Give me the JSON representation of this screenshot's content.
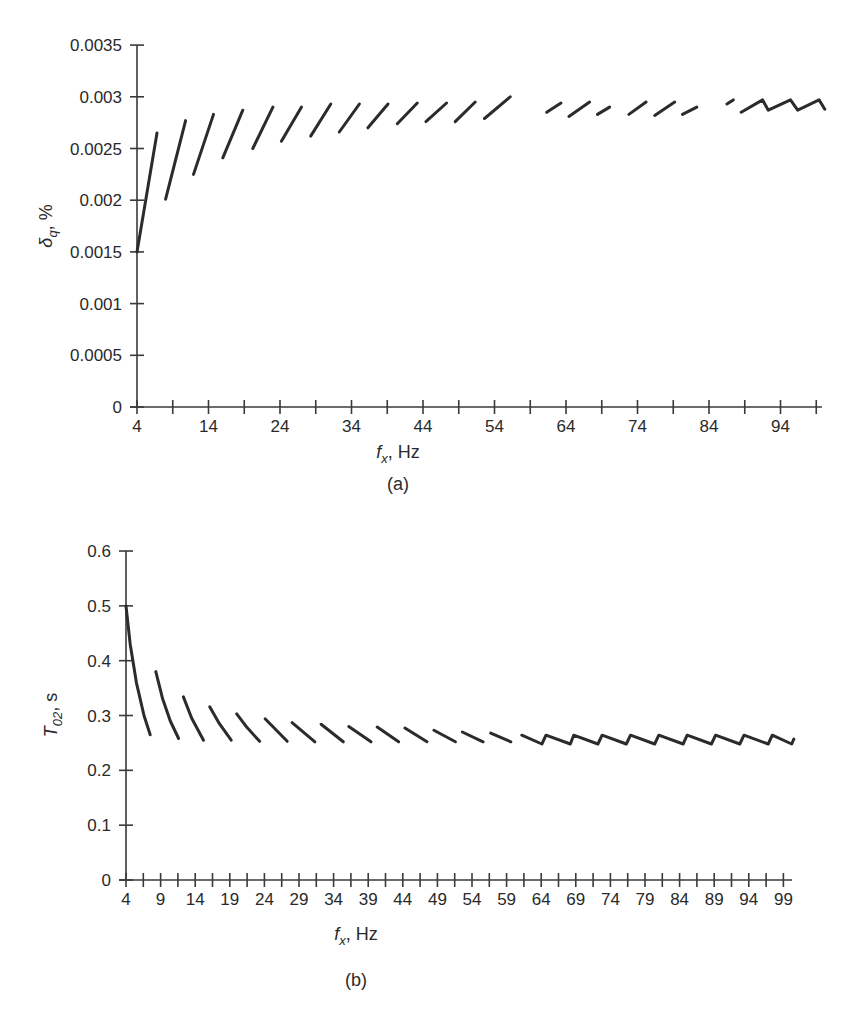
{
  "chart_data": [
    {
      "id": "a",
      "type": "line",
      "panel_label": "(a)",
      "title": "",
      "xlabel": "f_x, Hz",
      "xlabel_var": "f",
      "xlabel_sub": "x",
      "xlabel_unit": ", Hz",
      "ylabel": "δ_q, %",
      "ylabel_var": "δ",
      "ylabel_sub": "q",
      "ylabel_unit": ", %",
      "xlim": [
        4,
        100
      ],
      "ylim": [
        0,
        0.0035
      ],
      "grid": false,
      "legend": null,
      "x_ticks": [
        4,
        9,
        14,
        19,
        24,
        29,
        34,
        39,
        44,
        49,
        54,
        59,
        64,
        69,
        74,
        79,
        84,
        89,
        94,
        99
      ],
      "x_tick_labels": [
        "4",
        "14",
        "24",
        "34",
        "44",
        "54",
        "64",
        "74",
        "84",
        "94"
      ],
      "x_tick_label_values": [
        4,
        14,
        24,
        34,
        44,
        54,
        64,
        74,
        84,
        94
      ],
      "y_ticks": [
        0,
        0.0005,
        0.001,
        0.0015,
        0.002,
        0.0025,
        0.003,
        0.0035
      ],
      "y_tick_labels": [
        "0",
        "0.0005",
        "0.001",
        "0.0015",
        "0.002",
        "0.0025",
        "0.003",
        "0.0035"
      ],
      "series": [
        {
          "name": "δq segments",
          "segments": [
            [
              [
                4.0,
                0.0015
              ],
              [
                6.8,
                0.00265
              ]
            ],
            [
              [
                8.0,
                0.00201
              ],
              [
                10.8,
                0.00277
              ]
            ],
            [
              [
                11.9,
                0.00225
              ],
              [
                14.7,
                0.00283
              ]
            ],
            [
              [
                16.0,
                0.00241
              ],
              [
                18.8,
                0.00287
              ]
            ],
            [
              [
                20.2,
                0.0025
              ],
              [
                23.0,
                0.0029
              ]
            ],
            [
              [
                24.2,
                0.00257
              ],
              [
                27.0,
                0.0029
              ]
            ],
            [
              [
                28.3,
                0.00262
              ],
              [
                31.1,
                0.00293
              ]
            ],
            [
              [
                32.3,
                0.00266
              ],
              [
                35.1,
                0.00293
              ]
            ],
            [
              [
                36.3,
                0.0027
              ],
              [
                39.1,
                0.00293
              ]
            ],
            [
              [
                40.4,
                0.00274
              ],
              [
                43.2,
                0.00294
              ]
            ],
            [
              [
                44.4,
                0.00276
              ],
              [
                47.3,
                0.00294
              ]
            ],
            [
              [
                48.5,
                0.00276
              ],
              [
                51.3,
                0.00295
              ]
            ],
            [
              [
                52.6,
                0.00279
              ],
              [
                56.2,
                0.003
              ]
            ],
            [
              [
                61.3,
                0.00285
              ],
              [
                63.3,
                0.00294
              ]
            ],
            [
              [
                64.4,
                0.00281
              ],
              [
                67.3,
                0.00295
              ]
            ],
            [
              [
                68.4,
                0.00283
              ],
              [
                70.1,
                0.0029
              ]
            ],
            [
              [
                72.8,
                0.00283
              ],
              [
                75.2,
                0.00295
              ]
            ],
            [
              [
                76.4,
                0.00282
              ],
              [
                79.2,
                0.00295
              ]
            ],
            [
              [
                80.3,
                0.00283
              ],
              [
                82.3,
                0.0029
              ]
            ],
            [
              [
                86.5,
                0.00293
              ],
              [
                87.4,
                0.00297
              ]
            ],
            [
              [
                88.5,
                0.00285
              ],
              [
                91.5,
                0.00297
              ],
              [
                92.3,
                0.00287
              ],
              [
                95.4,
                0.00297
              ],
              [
                96.4,
                0.00287
              ],
              [
                99.4,
                0.00297
              ],
              [
                100.2,
                0.00288
              ]
            ]
          ]
        }
      ]
    },
    {
      "id": "b",
      "type": "line",
      "panel_label": "(b)",
      "title": "",
      "xlabel": "f_x, Hz",
      "xlabel_var": "f",
      "xlabel_sub": "x",
      "xlabel_unit": ", Hz",
      "ylabel": "T_02, s",
      "ylabel_var": "T",
      "ylabel_sub": "02",
      "ylabel_unit": ", s",
      "xlim": [
        4,
        100
      ],
      "ylim": [
        0,
        0.6
      ],
      "grid": false,
      "legend": null,
      "x_ticks": [
        4,
        6.5,
        9,
        11.5,
        14,
        16.5,
        19,
        21.5,
        24,
        26.5,
        29,
        31.5,
        34,
        36.5,
        39,
        41.5,
        44,
        46.5,
        49,
        51.5,
        54,
        56.5,
        59,
        61.5,
        64,
        66.5,
        69,
        71.5,
        74,
        76.5,
        79,
        81.5,
        84,
        86.5,
        89,
        91.5,
        94,
        96.5,
        99
      ],
      "x_tick_labels": [
        "4",
        "9",
        "14",
        "19",
        "24",
        "29",
        "34",
        "39",
        "44",
        "49",
        "54",
        "59",
        "64",
        "69",
        "74",
        "79",
        "84",
        "89",
        "94",
        "99"
      ],
      "x_tick_label_values": [
        4,
        9,
        14,
        19,
        24,
        29,
        34,
        39,
        44,
        49,
        54,
        59,
        64,
        69,
        74,
        79,
        84,
        89,
        94,
        99
      ],
      "y_ticks": [
        0,
        0.1,
        0.2,
        0.3,
        0.4,
        0.5,
        0.6
      ],
      "y_tick_labels": [
        "0",
        "0.1",
        "0.2",
        "0.3",
        "0.4",
        "0.5",
        "0.6"
      ],
      "series": [
        {
          "name": "T02 segments",
          "segments": [
            [
              [
                4.0,
                0.5
              ],
              [
                4.6,
                0.43
              ],
              [
                5.5,
                0.36
              ],
              [
                6.6,
                0.3
              ],
              [
                7.5,
                0.265
              ]
            ],
            [
              [
                8.3,
                0.38
              ],
              [
                9.3,
                0.33
              ],
              [
                10.4,
                0.29
              ],
              [
                11.6,
                0.258
              ]
            ],
            [
              [
                12.3,
                0.334
              ],
              [
                13.5,
                0.295
              ],
              [
                15.2,
                0.255
              ]
            ],
            [
              [
                16.1,
                0.316
              ],
              [
                17.5,
                0.285
              ],
              [
                19.2,
                0.255
              ]
            ],
            [
              [
                20.0,
                0.303
              ],
              [
                21.5,
                0.278
              ],
              [
                23.3,
                0.253
              ]
            ],
            [
              [
                24.1,
                0.294
              ],
              [
                27.3,
                0.253
              ]
            ],
            [
              [
                28.0,
                0.287
              ],
              [
                31.3,
                0.252
              ]
            ],
            [
              [
                32.2,
                0.284
              ],
              [
                35.4,
                0.252
              ]
            ],
            [
              [
                36.2,
                0.28
              ],
              [
                39.4,
                0.252
              ]
            ],
            [
              [
                40.3,
                0.279
              ],
              [
                43.4,
                0.252
              ]
            ],
            [
              [
                44.3,
                0.277
              ],
              [
                47.5,
                0.252
              ]
            ],
            [
              [
                48.5,
                0.273
              ],
              [
                51.6,
                0.252
              ]
            ],
            [
              [
                52.6,
                0.27
              ],
              [
                55.6,
                0.252
              ]
            ],
            [
              [
                56.7,
                0.268
              ],
              [
                59.6,
                0.252
              ]
            ],
            [
              [
                61.2,
                0.264
              ],
              [
                64.1,
                0.248
              ],
              [
                64.7,
                0.264
              ],
              [
                68.2,
                0.248
              ],
              [
                68.7,
                0.264
              ],
              [
                72.2,
                0.248
              ],
              [
                72.8,
                0.264
              ],
              [
                76.3,
                0.248
              ],
              [
                76.9,
                0.264
              ],
              [
                80.4,
                0.248
              ],
              [
                81.0,
                0.264
              ],
              [
                84.5,
                0.248
              ],
              [
                85.1,
                0.264
              ],
              [
                88.6,
                0.248
              ],
              [
                89.2,
                0.264
              ],
              [
                92.7,
                0.248
              ],
              [
                93.3,
                0.264
              ],
              [
                96.8,
                0.248
              ],
              [
                97.4,
                0.264
              ],
              [
                100.2,
                0.248
              ],
              [
                100.5,
                0.257
              ]
            ]
          ]
        }
      ]
    }
  ]
}
